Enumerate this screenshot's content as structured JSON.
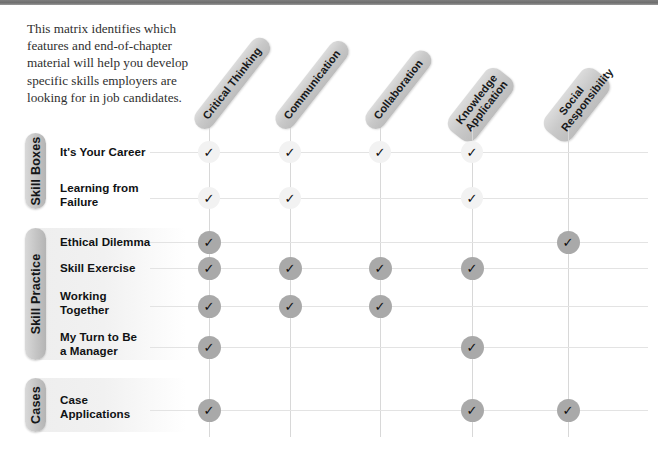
{
  "top_rule_color": "#6e6e6e",
  "intro": {
    "text": "This matrix identifies which features and end-of-chapter material will help you develop specific skills employers are looking for in job candidates."
  },
  "palette": {
    "pill_gray": "#c6c6c6",
    "mark_dark": "#a9a9a9",
    "mark_light": "#f2f2f2",
    "rule_gray": "#e3e3e3",
    "band_gray": "#efefef"
  },
  "columns": [
    {
      "id": "critical-thinking",
      "label": "Critical Thinking",
      "lines": [
        "Critical Thinking"
      ],
      "x": 209
    },
    {
      "id": "communication",
      "label": "Communication",
      "lines": [
        "Communication"
      ],
      "x": 290
    },
    {
      "id": "collaboration",
      "label": "Collaboration",
      "lines": [
        "Collaboration"
      ],
      "x": 380
    },
    {
      "id": "knowledge-application",
      "label": "Knowledge Application",
      "lines": [
        "Knowledge",
        "Application"
      ],
      "x": 472
    },
    {
      "id": "social-responsibility",
      "label": "Social Responsibility",
      "lines": [
        "Social",
        "Responsibility"
      ],
      "x": 568
    }
  ],
  "groups": [
    {
      "id": "skill-boxes",
      "label": "Skill Boxes",
      "banded": false,
      "top": 133,
      "height": 76,
      "rows": [
        {
          "id": "its-your-career",
          "lines": [
            "It's Your Career"
          ],
          "y": 152,
          "style": "light",
          "marks": [
            true,
            true,
            true,
            true,
            false
          ]
        },
        {
          "id": "learning-from-failure",
          "lines": [
            "Learning from",
            "Failure"
          ],
          "y": 198,
          "style": "light",
          "marks": [
            true,
            true,
            false,
            true,
            false
          ]
        }
      ]
    },
    {
      "id": "skill-practice",
      "label": "Skill Practice",
      "banded": true,
      "top": 228,
      "height": 132,
      "rows": [
        {
          "id": "ethical-dilemma",
          "lines": [
            "Ethical Dilemma"
          ],
          "y": 242,
          "style": "dark",
          "marks": [
            true,
            false,
            false,
            false,
            true
          ]
        },
        {
          "id": "skill-exercise",
          "lines": [
            "Skill Exercise"
          ],
          "y": 268,
          "style": "dark",
          "marks": [
            true,
            true,
            true,
            true,
            false
          ]
        },
        {
          "id": "working-together",
          "lines": [
            "Working",
            "Together"
          ],
          "y": 306,
          "style": "dark",
          "marks": [
            true,
            true,
            true,
            false,
            false
          ]
        },
        {
          "id": "my-turn-to-be-a-manager",
          "lines": [
            "My Turn to Be",
            "a Manager"
          ],
          "y": 347,
          "style": "dark",
          "marks": [
            true,
            false,
            false,
            true,
            false
          ]
        }
      ]
    },
    {
      "id": "cases",
      "label": "Cases",
      "banded": true,
      "top": 378,
      "height": 54,
      "rows": [
        {
          "id": "case-applications",
          "lines": [
            "Case",
            "Applications"
          ],
          "y": 410,
          "style": "dark",
          "marks": [
            true,
            false,
            false,
            true,
            true
          ]
        }
      ]
    }
  ],
  "icons": {
    "check": "✓"
  }
}
